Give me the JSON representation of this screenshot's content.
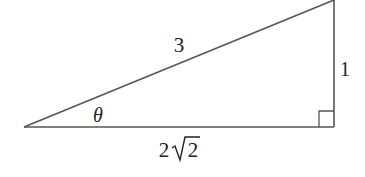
{
  "diagram": {
    "type": "right-triangle",
    "vertices": {
      "left": [
        24,
        127
      ],
      "right_angle": [
        334,
        127
      ],
      "top": [
        334,
        0
      ]
    },
    "labels": {
      "hypotenuse": "3",
      "opposite": "1",
      "adjacent_coef": "2",
      "adjacent_radicand": "2",
      "angle": "θ"
    },
    "right_angle_marker": true,
    "colors": {
      "stroke": "#444444",
      "text": "#222222",
      "background": "#ffffff"
    }
  }
}
